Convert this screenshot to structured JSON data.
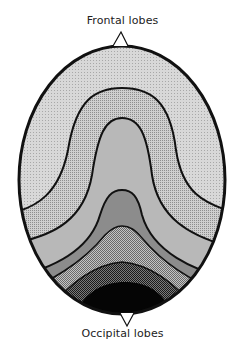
{
  "labels": {
    "top": "Frontal lobes",
    "bottom": "Occipital lobes"
  },
  "diagram": {
    "shape": "head-oval-top-view",
    "bands": [
      {
        "name": "band-1-outer",
        "fill": "#d4d4d4",
        "pattern": "fine-dots"
      },
      {
        "name": "band-2",
        "fill": "#bdbdbd",
        "pattern": "dots"
      },
      {
        "name": "band-3",
        "fill": "#b5b5b5",
        "pattern": "smooth"
      },
      {
        "name": "band-4",
        "fill": "#8a8a8a",
        "pattern": "smooth"
      },
      {
        "name": "band-5",
        "fill": "#9a9a9a",
        "pattern": "checker"
      },
      {
        "name": "band-6",
        "fill": "#5a5a5a",
        "pattern": "dense-checker"
      },
      {
        "name": "band-7-core",
        "fill": "#050505",
        "pattern": "solid"
      }
    ],
    "outline_color": "#111111"
  }
}
